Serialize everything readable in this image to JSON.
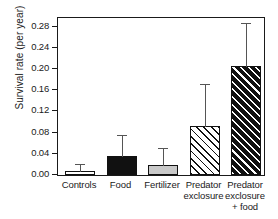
{
  "chart_data": {
    "type": "bar",
    "title": "",
    "xlabel": "",
    "ylabel": "Survival rate (per year)",
    "categories": [
      "Controls",
      "Food",
      "Fertilizer",
      "Predator\nexclosure",
      "Predator\nexclosure\n+ food"
    ],
    "values": [
      0.007,
      0.036,
      0.018,
      0.092,
      0.206
    ],
    "errors_upper": [
      0.018,
      0.073,
      0.049,
      0.17,
      0.285
    ],
    "ylim": [
      0.0,
      0.3
    ],
    "yticks": [
      0.0,
      0.04,
      0.08,
      0.12,
      0.16,
      0.2,
      0.24,
      0.28
    ],
    "ytick_labels": [
      "0.00",
      "0.04",
      "0.08",
      "0.12",
      "0.16",
      "0.20",
      "0.24",
      "0.28"
    ],
    "grid": false,
    "legend": false,
    "bar_styles": [
      "white",
      "black",
      "grey",
      "hatch-light",
      "hatch-dark"
    ],
    "colors": {
      "axis": "#1a1a1a",
      "bar_white": "#ffffff",
      "bar_black": "#111111",
      "bar_grey": "#c9c9c9",
      "error": "#555555",
      "background": "#ffffff"
    }
  }
}
